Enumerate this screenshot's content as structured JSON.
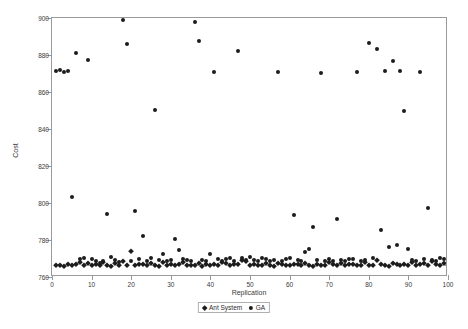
{
  "chart_data": {
    "type": "scatter",
    "title": "",
    "xlabel": "Replication",
    "ylabel": "Cost",
    "xlim": [
      0,
      100
    ],
    "ylim": [
      760,
      900
    ],
    "xticks": [
      0,
      10,
      20,
      30,
      40,
      50,
      60,
      70,
      80,
      90,
      100
    ],
    "yticks": [
      760,
      780,
      800,
      820,
      840,
      860,
      880,
      900
    ],
    "grid": false,
    "legend_position": "bottom-center",
    "marker_color": "#1c1c1c",
    "series": [
      {
        "name": "Ant System",
        "marker": "diamond",
        "points": [
          [
            1,
            766.3
          ],
          [
            2,
            766.5
          ],
          [
            3,
            766.2
          ],
          [
            4,
            767.0
          ],
          [
            5,
            766.4
          ],
          [
            6,
            766.8
          ],
          [
            7,
            768.2
          ],
          [
            8,
            766.5
          ],
          [
            9,
            767.6
          ],
          [
            10,
            766.3
          ],
          [
            11,
            766.9
          ],
          [
            12,
            766.4
          ],
          [
            13,
            768.0
          ],
          [
            14,
            766.6
          ],
          [
            15,
            766.2
          ],
          [
            16,
            767.3
          ],
          [
            17,
            766.5
          ],
          [
            18,
            768.4
          ],
          [
            19,
            766.7
          ],
          [
            20,
            774.2
          ],
          [
            21,
            766.4
          ],
          [
            22,
            767.1
          ],
          [
            23,
            766.8
          ],
          [
            24,
            766.3
          ],
          [
            25,
            767.5
          ],
          [
            26,
            766.6
          ],
          [
            27,
            766.2
          ],
          [
            28,
            767.9
          ],
          [
            29,
            766.5
          ],
          [
            30,
            766.9
          ],
          [
            31,
            766.4
          ],
          [
            32,
            767.2
          ],
          [
            33,
            768.1
          ],
          [
            34,
            766.7
          ],
          [
            35,
            766.3
          ],
          [
            36,
            766.5
          ],
          [
            37,
            767.4
          ],
          [
            38,
            766.2
          ],
          [
            39,
            766.8
          ],
          [
            40,
            766.6
          ],
          [
            41,
            767.0
          ],
          [
            42,
            766.4
          ],
          [
            43,
            768.3
          ],
          [
            44,
            767.7
          ],
          [
            45,
            766.5
          ],
          [
            46,
            766.9
          ],
          [
            47,
            767.2
          ],
          [
            48,
            769.0
          ],
          [
            49,
            768.6
          ],
          [
            50,
            766.4
          ],
          [
            51,
            767.1
          ],
          [
            52,
            766.7
          ],
          [
            53,
            766.3
          ],
          [
            54,
            767.8
          ],
          [
            55,
            766.5
          ],
          [
            56,
            766.2
          ],
          [
            57,
            767.3
          ],
          [
            58,
            766.9
          ],
          [
            59,
            766.4
          ],
          [
            60,
            766.6
          ],
          [
            61,
            767.0
          ],
          [
            62,
            766.8
          ],
          [
            63,
            766.3
          ],
          [
            64,
            767.5
          ],
          [
            65,
            766.5
          ],
          [
            66,
            766.2
          ],
          [
            67,
            767.1
          ],
          [
            68,
            766.7
          ],
          [
            69,
            766.4
          ],
          [
            70,
            768.0
          ],
          [
            71,
            766.9
          ],
          [
            72,
            766.3
          ],
          [
            73,
            767.6
          ],
          [
            74,
            766.5
          ],
          [
            75,
            766.8
          ],
          [
            76,
            767.2
          ],
          [
            77,
            766.4
          ],
          [
            78,
            766.6
          ],
          [
            79,
            767.9
          ],
          [
            80,
            766.3
          ],
          [
            81,
            766.5
          ],
          [
            82,
            769.4
          ],
          [
            83,
            767.0
          ],
          [
            84,
            766.7
          ],
          [
            85,
            766.2
          ],
          [
            86,
            767.4
          ],
          [
            87,
            766.8
          ],
          [
            88,
            766.5
          ],
          [
            89,
            767.1
          ],
          [
            90,
            766.3
          ],
          [
            91,
            768.2
          ],
          [
            92,
            766.6
          ],
          [
            93,
            766.9
          ],
          [
            94,
            767.3
          ],
          [
            95,
            766.4
          ],
          [
            96,
            768.5
          ],
          [
            97,
            767.0
          ],
          [
            98,
            766.6
          ],
          [
            99,
            767.8
          ],
          [
            100,
            766.5
          ]
        ]
      },
      {
        "name": "GA",
        "marker": "circle",
        "points": [
          [
            1,
            871.5
          ],
          [
            2,
            871.8
          ],
          [
            3,
            871.0
          ],
          [
            4,
            871.6
          ],
          [
            5,
            803.0
          ],
          [
            6,
            881.2
          ],
          [
            7,
            769.8
          ],
          [
            8,
            770.2
          ],
          [
            9,
            877.5
          ],
          [
            10,
            769.5
          ],
          [
            11,
            768.4
          ],
          [
            12,
            767.8
          ],
          [
            13,
            768.9
          ],
          [
            14,
            794.0
          ],
          [
            15,
            770.6
          ],
          [
            16,
            769.2
          ],
          [
            17,
            768.3
          ],
          [
            18,
            899.0
          ],
          [
            19,
            886.0
          ],
          [
            20,
            768.8
          ],
          [
            21,
            795.5
          ],
          [
            22,
            769.6
          ],
          [
            23,
            782.0
          ],
          [
            24,
            768.5
          ],
          [
            25,
            770.1
          ],
          [
            26,
            850.5
          ],
          [
            27,
            769.0
          ],
          [
            28,
            772.3
          ],
          [
            29,
            768.6
          ],
          [
            30,
            769.4
          ],
          [
            31,
            780.5
          ],
          [
            32,
            774.8
          ],
          [
            33,
            770.0
          ],
          [
            34,
            769.3
          ],
          [
            35,
            768.7
          ],
          [
            36,
            898.0
          ],
          [
            37,
            887.5
          ],
          [
            38,
            769.1
          ],
          [
            39,
            768.9
          ],
          [
            40,
            772.6
          ],
          [
            41,
            870.8
          ],
          [
            42,
            769.5
          ],
          [
            43,
            768.4
          ],
          [
            44,
            769.8
          ],
          [
            45,
            770.3
          ],
          [
            46,
            768.6
          ],
          [
            47,
            882.0
          ],
          [
            48,
            770.5
          ],
          [
            49,
            769.2
          ],
          [
            50,
            770.8
          ],
          [
            51,
            769.0
          ],
          [
            52,
            768.5
          ],
          [
            53,
            770.1
          ],
          [
            54,
            769.6
          ],
          [
            55,
            768.8
          ],
          [
            56,
            769.3
          ],
          [
            57,
            870.6
          ],
          [
            58,
            768.7
          ],
          [
            59,
            769.9
          ],
          [
            60,
            770.4
          ],
          [
            61,
            793.5
          ],
          [
            62,
            769.1
          ],
          [
            63,
            768.6
          ],
          [
            64,
            773.5
          ],
          [
            65,
            775.0
          ],
          [
            66,
            787.0
          ],
          [
            67,
            769.4
          ],
          [
            68,
            870.5
          ],
          [
            69,
            768.9
          ],
          [
            70,
            769.7
          ],
          [
            71,
            768.5
          ],
          [
            72,
            791.5
          ],
          [
            73,
            769.2
          ],
          [
            74,
            768.8
          ],
          [
            75,
            770.0
          ],
          [
            76,
            769.5
          ],
          [
            77,
            871.0
          ],
          [
            78,
            768.7
          ],
          [
            79,
            769.3
          ],
          [
            80,
            886.5
          ],
          [
            81,
            770.2
          ],
          [
            82,
            883.0
          ],
          [
            83,
            785.5
          ],
          [
            84,
            871.5
          ],
          [
            85,
            776.0
          ],
          [
            86,
            877.0
          ],
          [
            87,
            777.5
          ],
          [
            88,
            871.2
          ],
          [
            89,
            850.0
          ],
          [
            90,
            775.0
          ],
          [
            91,
            769.0
          ],
          [
            92,
            768.6
          ],
          [
            93,
            871.0
          ],
          [
            94,
            769.8
          ],
          [
            95,
            797.5
          ],
          [
            96,
            769.4
          ],
          [
            97,
            768.9
          ],
          [
            98,
            770.1
          ],
          [
            99,
            769.5
          ],
          [
            100,
            768.7
          ]
        ]
      }
    ]
  },
  "legend": {
    "items": [
      {
        "label": "Ant System",
        "marker": "diamond"
      },
      {
        "label": "GA",
        "marker": "circle"
      }
    ]
  }
}
